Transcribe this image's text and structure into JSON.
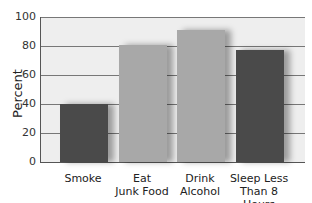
{
  "chart_data": {
    "type": "bar",
    "title": "",
    "xlabel": "",
    "ylabel": "Percent",
    "ylim": [
      0,
      100
    ],
    "yticks": [
      0,
      20,
      40,
      60,
      80,
      100
    ],
    "grid": true,
    "legend": null,
    "categories": [
      "Smoke",
      "Eat Junk Food",
      "Drink Alcohol",
      "Sleep Less Than 8 Hours"
    ],
    "category_lines": [
      [
        "Smoke"
      ],
      [
        "Eat",
        "Junk Food"
      ],
      [
        "Drink",
        "Alcohol"
      ],
      [
        "Sleep Less",
        "Than 8 Hours"
      ]
    ],
    "values": [
      40,
      81,
      91,
      77
    ],
    "colors": [
      "#4a4a4a",
      "#a8a8a8",
      "#a8a8a8",
      "#4a4a4a"
    ]
  }
}
